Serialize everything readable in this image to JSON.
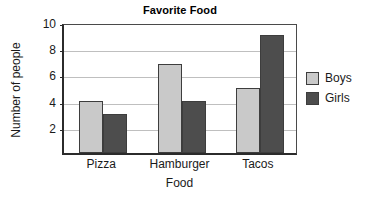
{
  "chart_data": {
    "type": "bar",
    "title": "Favorite Food",
    "xlabel": "Food",
    "ylabel": "Number of people",
    "categories": [
      "Pizza",
      "Hamburger",
      "Tacos"
    ],
    "series": [
      {
        "name": "Boys",
        "values": [
          4,
          6.8,
          5
        ],
        "color": "#c9c9c9"
      },
      {
        "name": "Girls",
        "values": [
          3,
          4,
          9
        ],
        "color": "#4d4d4d"
      }
    ],
    "ylim": [
      0,
      10
    ],
    "yticks": [
      2,
      4,
      6,
      8,
      10
    ],
    "grid": true,
    "legend_position": "right"
  },
  "legend": {
    "entries": [
      {
        "label": "Boys",
        "color": "#c9c9c9"
      },
      {
        "label": "Girls",
        "color": "#4d4d4d"
      }
    ]
  }
}
